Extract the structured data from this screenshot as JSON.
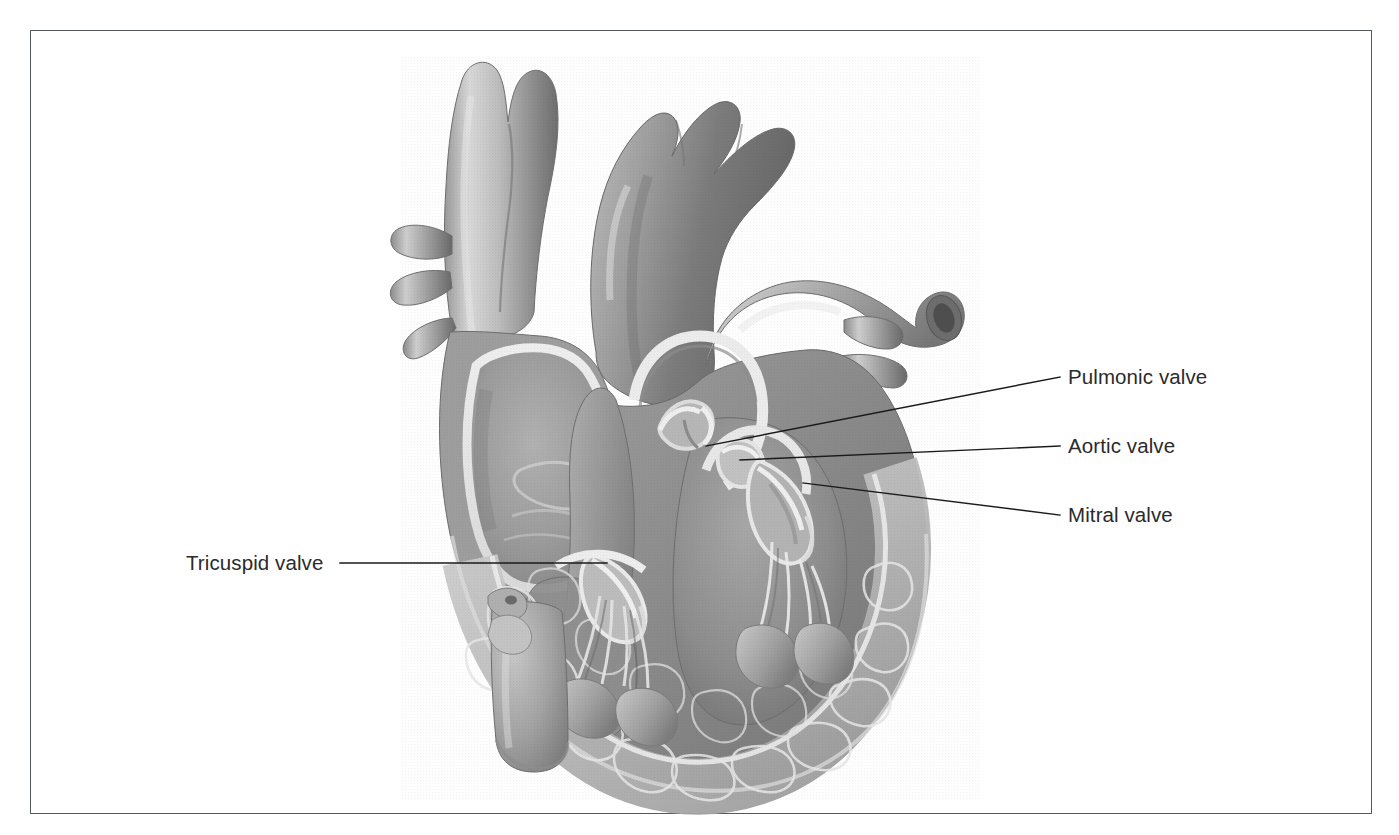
{
  "figure": {
    "kind": "anatomical-illustration",
    "style": "grayscale halftone medical illustration",
    "frame": {
      "visible": true,
      "color": "#555a5e"
    },
    "background_color": "#ffffff"
  },
  "labels": [
    {
      "id": "pulmonic-valve",
      "text": "Pulmonic valve",
      "side": "right",
      "text_x": 1068,
      "text_y": 382,
      "leader": {
        "x1": 1060,
        "y1": 377,
        "x2": 706,
        "y2": 446
      }
    },
    {
      "id": "aortic-valve",
      "text": "Aortic valve",
      "side": "right",
      "text_x": 1068,
      "text_y": 451,
      "leader": {
        "x1": 1060,
        "y1": 446,
        "x2": 740,
        "y2": 460
      }
    },
    {
      "id": "mitral-valve",
      "text": "Mitral valve",
      "side": "right",
      "text_x": 1068,
      "text_y": 520,
      "leader": {
        "x1": 1060,
        "y1": 515,
        "x2": 803,
        "y2": 483
      }
    },
    {
      "id": "tricuspid-valve",
      "text": "Tricuspid valve",
      "side": "left",
      "text_x": 186,
      "text_y": 568,
      "leader": {
        "x1": 340,
        "y1": 563,
        "x2": 607,
        "y2": 563
      }
    }
  ],
  "leader_line": {
    "color": "#1a1a1a",
    "width": 1.4
  },
  "palette": {
    "ink": "#2b2b2b",
    "frame": "#555a5e",
    "paper": "#ffffff",
    "tissue_light": "#d6d6d6",
    "tissue_mid": "#a9a9a9",
    "tissue_dark": "#7e7e7e",
    "tissue_darkest": "#5d5d5d",
    "endocardium_highlight": "#efefef",
    "lumen_shadow": "#8a8a8a"
  },
  "anatomy_parts": [
    "superior vena cava",
    "aorta",
    "aortic arch branches",
    "pulmonary trunk",
    "right pulmonary artery",
    "pulmonary veins",
    "right atrium",
    "right ventricle",
    "left ventricle",
    "interventricular septum",
    "papillary muscles",
    "chordae tendineae",
    "trabeculae carneae",
    "myocardium",
    "inferior vena cava",
    "pulmonic valve",
    "aortic valve",
    "mitral valve",
    "tricuspid valve"
  ]
}
